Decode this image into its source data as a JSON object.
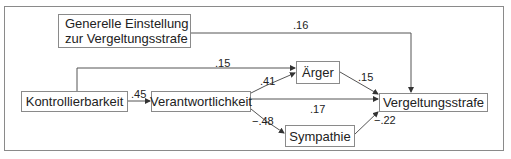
{
  "diagram": {
    "nodes": {
      "general_attitude": {
        "line1": "Generelle Einstellung",
        "line2": "zur Vergeltungsstrafe"
      },
      "controllability": {
        "label": "Kontrollierbarkeit"
      },
      "responsibility": {
        "label": "Verantwortlichkeit"
      },
      "anger": {
        "label": "Ärger"
      },
      "sympathy": {
        "label": "Sympathie"
      },
      "retribution": {
        "label": "Vergeltungsstrafe"
      }
    },
    "edges": [
      {
        "from": "Generelle Einstellung zur Vergeltungsstrafe",
        "to": "Vergeltungsstrafe",
        "coef": ".16"
      },
      {
        "from": "Kontrollierbarkeit",
        "to": "Ärger",
        "coef": ".15"
      },
      {
        "from": "Kontrollierbarkeit",
        "to": "Verantwortlichkeit",
        "coef": ".45"
      },
      {
        "from": "Verantwortlichkeit",
        "to": "Ärger",
        "coef": ".41"
      },
      {
        "from": "Verantwortlichkeit",
        "to": "Vergeltungsstrafe",
        "coef": ".17"
      },
      {
        "from": "Verantwortlichkeit",
        "to": "Sympathie",
        "coef": "−.48"
      },
      {
        "from": "Ärger",
        "to": "Vergeltungsstrafe",
        "coef": ".15"
      },
      {
        "from": "Sympathie",
        "to": "Vergeltungsstrafe",
        "coef": "−.22"
      }
    ]
  }
}
